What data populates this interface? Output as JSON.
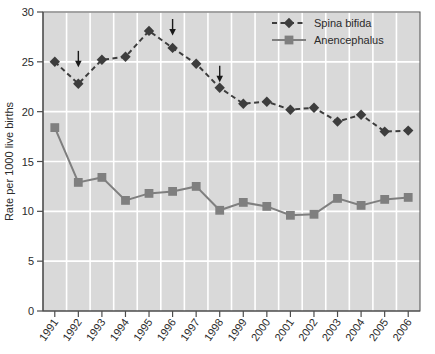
{
  "chart_data": {
    "type": "line",
    "title": "",
    "xlabel": "",
    "ylabel": "Rate per 1000 live births",
    "categories": [
      "1991",
      "1992",
      "1993",
      "1994",
      "1995",
      "1996",
      "1997",
      "1998",
      "1999",
      "2000",
      "2001",
      "2002",
      "2003",
      "2004",
      "2005",
      "2006"
    ],
    "ylim": [
      0,
      30
    ],
    "yticks": [
      0,
      5,
      10,
      15,
      20,
      25,
      30
    ],
    "ytick_labels": [
      "0",
      "5",
      "10",
      "15",
      "20",
      "25",
      "30"
    ],
    "grid": true,
    "legend_position": "top-right",
    "series": [
      {
        "name": "Spina bifida",
        "marker": "diamond",
        "linestyle": "dashed",
        "color": "#3d3d3d",
        "values": [
          25.0,
          22.8,
          25.2,
          25.5,
          28.1,
          26.4,
          24.8,
          22.4,
          20.8,
          21.0,
          20.2,
          20.4,
          19.0,
          19.7,
          18.0,
          18.1
        ]
      },
      {
        "name": "Anencephalus",
        "marker": "square",
        "linestyle": "solid",
        "color": "#7f7f7f",
        "values": [
          18.4,
          12.9,
          13.4,
          11.1,
          11.8,
          12.0,
          12.5,
          10.1,
          10.9,
          10.5,
          9.6,
          9.7,
          11.3,
          10.6,
          11.2,
          11.4
        ]
      }
    ],
    "annotations": [
      {
        "name": "arrow-1992",
        "category": "1992",
        "glyph": "down-arrow",
        "y_value": 26.1
      },
      {
        "name": "arrow-1996",
        "category": "1996",
        "glyph": "down-arrow",
        "y_value": 29.3
      },
      {
        "name": "arrow-1998",
        "category": "1998",
        "glyph": "down-arrow",
        "y_value": 24.6
      }
    ],
    "colors": {
      "plot_background": "#d9d9d9",
      "gridline": "#ffffff",
      "axis": "#4d4d4d",
      "spina_bifida": "#3d3d3d",
      "anencephalus": "#7f7f7f",
      "page_background": "#ffffff"
    }
  }
}
